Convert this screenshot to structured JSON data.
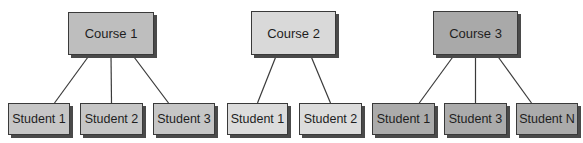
{
  "diagram": {
    "type": "hierarchy",
    "groups": [
      {
        "course": {
          "label": "Course 1",
          "x": 68,
          "y": 12,
          "w": 86,
          "h": 43,
          "fill": "#bebebe"
        },
        "students": [
          {
            "label": "Student 1",
            "x": 8,
            "y": 103,
            "w": 62,
            "h": 32,
            "fill": "#c6c6c6"
          },
          {
            "label": "Student 2",
            "x": 80,
            "y": 103,
            "w": 63,
            "h": 32,
            "fill": "#c6c6c6"
          },
          {
            "label": "Student 3",
            "x": 153,
            "y": 103,
            "w": 62,
            "h": 32,
            "fill": "#c6c6c6"
          }
        ]
      },
      {
        "course": {
          "label": "Course 2",
          "x": 251,
          "y": 11,
          "w": 85,
          "h": 44,
          "fill": "#d9d9d9"
        },
        "students": [
          {
            "label": "Student 1",
            "x": 227,
            "y": 103,
            "w": 61,
            "h": 32,
            "fill": "#dcdcdc"
          },
          {
            "label": "Student 2",
            "x": 299,
            "y": 103,
            "w": 63,
            "h": 32,
            "fill": "#dcdcdc"
          }
        ]
      },
      {
        "course": {
          "label": "Course 3",
          "x": 433,
          "y": 11,
          "w": 85,
          "h": 44,
          "fill": "#a9a9a9"
        },
        "students": [
          {
            "label": "Student 1",
            "x": 372,
            "y": 103,
            "w": 63,
            "h": 32,
            "fill": "#ababab"
          },
          {
            "label": "Student 3",
            "x": 444,
            "y": 103,
            "w": 63,
            "h": 32,
            "fill": "#ababab"
          },
          {
            "label": "Student N",
            "x": 516,
            "y": 103,
            "w": 62,
            "h": 32,
            "fill": "#ababab"
          }
        ]
      }
    ],
    "colors": {
      "border": "#3a3a3a",
      "line": "#3a3a3a",
      "shadow": "#4a4a4a",
      "text": "#1e1e1e"
    }
  }
}
